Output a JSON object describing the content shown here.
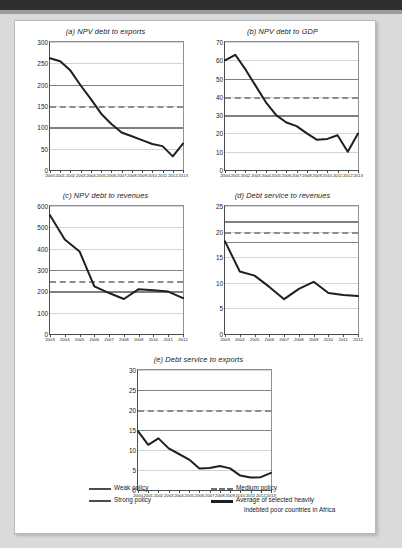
{
  "figure": {
    "background_color": "#d8dadb",
    "page_color": "#ffffff"
  },
  "legend": {
    "items": [
      {
        "label": "Weak policy",
        "style": "solid-thin",
        "color": "#4a4c4e"
      },
      {
        "label": "Medium policy",
        "style": "dashed",
        "color": "#6e7173"
      },
      {
        "label": "Strong policy",
        "style": "solid-thin",
        "color": "#4a4c4e"
      },
      {
        "label": "Average of selected heavily",
        "label2": "indebted poor countries in Africa",
        "style": "solid-thick",
        "color": "#1d1f21"
      }
    ]
  },
  "chart_data": [
    {
      "type": "line",
      "title": "(a) NPV debt to exports",
      "xlabel": "",
      "ylabel": "",
      "ylim": [
        0,
        300
      ],
      "yticks": [
        0,
        50,
        100,
        150,
        200,
        250,
        300
      ],
      "grid": true,
      "x": [
        "2000",
        "2001",
        "2002",
        "2003",
        "2004",
        "2005",
        "2006",
        "2007",
        "2008",
        "2009",
        "2010",
        "2011",
        "2012",
        "2013"
      ],
      "series": [
        {
          "name": "Average of selected heavily indebted poor countries in Africa",
          "values": [
            262,
            255,
            233,
            198,
            166,
            132,
            108,
            88,
            79,
            70,
            61,
            56,
            32,
            62
          ]
        }
      ],
      "thresholds": [
        {
          "name": "Weak policy",
          "value": 100,
          "style": "solid"
        },
        {
          "name": "Medium policy",
          "value": 150,
          "style": "dashed"
        },
        {
          "name": "Strong policy",
          "value": 200,
          "style": "solid"
        }
      ]
    },
    {
      "type": "line",
      "title": "(b) NPV debt to GDP",
      "xlabel": "",
      "ylabel": "",
      "ylim": [
        0,
        70
      ],
      "yticks": [
        0,
        10,
        20,
        30,
        40,
        50,
        60,
        70
      ],
      "grid": true,
      "x": [
        "2000",
        "2001",
        "2002",
        "2003",
        "2004",
        "2005",
        "2006",
        "2007",
        "2008",
        "2009",
        "2010",
        "2011",
        "2012",
        "2013"
      ],
      "series": [
        {
          "name": "Average of selected heavily indebted poor countries in Africa",
          "values": [
            60,
            63,
            55,
            46,
            37,
            30,
            26,
            24,
            20,
            16.5,
            17,
            19,
            10,
            20
          ]
        }
      ],
      "thresholds": [
        {
          "name": "Weak policy",
          "value": 30,
          "style": "solid"
        },
        {
          "name": "Medium policy",
          "value": 40,
          "style": "dashed"
        },
        {
          "name": "Strong policy",
          "value": 50,
          "style": "solid"
        }
      ]
    },
    {
      "type": "line",
      "title": "(c) NPV debt to revenues",
      "xlabel": "",
      "ylabel": "",
      "ylim": [
        0,
        600
      ],
      "yticks": [
        0,
        100,
        200,
        300,
        400,
        500,
        600
      ],
      "grid": true,
      "x": [
        "2003",
        "2004",
        "2005",
        "2006",
        "2007",
        "2008",
        "2009",
        "2010",
        "2011",
        "2012"
      ],
      "series": [
        {
          "name": "Average of selected heavily indebted poor countries in Africa",
          "values": [
            557,
            443,
            387,
            223,
            192,
            164,
            210,
            205,
            199,
            168
          ]
        }
      ],
      "thresholds": [
        {
          "name": "Weak policy",
          "value": 200,
          "style": "solid"
        },
        {
          "name": "Medium policy",
          "value": 250,
          "style": "dashed"
        },
        {
          "name": "Strong policy",
          "value": 300,
          "style": "solid"
        }
      ]
    },
    {
      "type": "line",
      "title": "(d) Debt service to revenues",
      "xlabel": "",
      "ylabel": "",
      "ylim": [
        0,
        25
      ],
      "yticks": [
        0,
        5,
        10,
        15,
        20,
        25
      ],
      "grid": true,
      "x": [
        "2003",
        "2004",
        "2005",
        "2006",
        "2007",
        "2008",
        "2009",
        "2010",
        "2011",
        "2012"
      ],
      "series": [
        {
          "name": "Average of selected heavily indebted poor countries in Africa",
          "values": [
            18.1,
            12.2,
            11.4,
            9.2,
            6.8,
            8.8,
            10.2,
            8.0,
            7.6,
            7.4
          ]
        }
      ],
      "thresholds": [
        {
          "name": "Weak policy",
          "value": 18,
          "style": "solid"
        },
        {
          "name": "Medium policy",
          "value": 20,
          "style": "dashed"
        },
        {
          "name": "Strong policy",
          "value": 22,
          "style": "solid"
        }
      ]
    },
    {
      "type": "line",
      "title": "(e) Debt service to exports",
      "xlabel": "",
      "ylabel": "",
      "ylim": [
        0,
        30
      ],
      "yticks": [
        0,
        5,
        10,
        15,
        20,
        25,
        30
      ],
      "grid": true,
      "x": [
        "2000",
        "2001",
        "2002",
        "2003",
        "2004",
        "2005",
        "2006",
        "2007",
        "2008",
        "2009",
        "2010",
        "2011",
        "2012",
        "2013"
      ],
      "series": [
        {
          "name": "Average of selected heavily indebted poor countries in Africa",
          "values": [
            14.7,
            11.3,
            12.9,
            10.4,
            9.0,
            7.6,
            5.4,
            5.5,
            6.0,
            5.4,
            3.6,
            3.1,
            3.2,
            4.3
          ]
        }
      ],
      "thresholds": [
        {
          "name": "Weak policy",
          "value": 15,
          "style": "solid"
        },
        {
          "name": "Medium policy",
          "value": 20,
          "style": "dashed"
        },
        {
          "name": "Strong policy",
          "value": 25,
          "style": "solid"
        }
      ]
    }
  ]
}
